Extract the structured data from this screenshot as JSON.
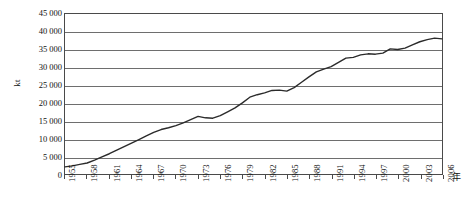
{
  "chart_data": {
    "type": "line",
    "title": "",
    "xlabel": "年",
    "ylabel": "kt",
    "ylim": [
      0,
      45000
    ],
    "xlim": [
      1955,
      2006
    ],
    "grid": true,
    "legend": "none",
    "y_ticks": [
      "45 000",
      "40 000",
      "35 000",
      "30 000",
      "25 000",
      "20 000",
      "15 000",
      "10 000",
      "5 000",
      "0"
    ],
    "y_tick_values": [
      45000,
      40000,
      35000,
      30000,
      25000,
      20000,
      15000,
      10000,
      5000,
      0
    ],
    "x_ticks": [
      "1955",
      "1958",
      "1961",
      "1964",
      "1967",
      "1970",
      "1973",
      "1976",
      "1979",
      "1982",
      "1985",
      "1988",
      "1991",
      "1994",
      "1997",
      "2000",
      "2003",
      "2006"
    ],
    "x_tick_values": [
      1955,
      1958,
      1961,
      1964,
      1967,
      1970,
      1973,
      1976,
      1979,
      1982,
      1985,
      1988,
      1991,
      1994,
      1997,
      2000,
      2003,
      2006
    ],
    "series": [
      {
        "name": "",
        "color": "#2b2b2b",
        "x": [
          1955,
          1956,
          1957,
          1958,
          1959,
          1960,
          1961,
          1962,
          1963,
          1964,
          1965,
          1966,
          1967,
          1968,
          1969,
          1970,
          1971,
          1972,
          1973,
          1974,
          1975,
          1976,
          1977,
          1978,
          1979,
          1980,
          1981,
          1982,
          1983,
          1984,
          1985,
          1986,
          1987,
          1988,
          1989,
          1990,
          1991,
          1992,
          1993,
          1994,
          1995,
          1996,
          1997,
          1998,
          1999,
          2000,
          2001,
          2002,
          2003,
          2004,
          2005,
          2006
        ],
        "y": [
          2000,
          2300,
          2700,
          3100,
          3900,
          4800,
          5700,
          6700,
          7700,
          8700,
          9700,
          10700,
          11700,
          12500,
          13000,
          13600,
          14400,
          15300,
          16200,
          15800,
          15700,
          16400,
          17500,
          18600,
          20000,
          21600,
          22300,
          22800,
          23500,
          23600,
          23300,
          24300,
          25800,
          27300,
          28700,
          29500,
          30200,
          31400,
          32600,
          32800,
          33500,
          33800,
          33700,
          34000,
          35200,
          35000,
          35400,
          36300,
          37200,
          37800,
          38200,
          38000
        ]
      }
    ]
  }
}
